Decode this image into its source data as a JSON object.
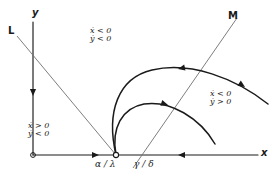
{
  "figure": {
    "type": "phase-plane-diagram",
    "background": "#ffffff",
    "ink": "#1a1a1a",
    "nullcline_color": "#6f6f6f",
    "width": 275,
    "height": 183
  },
  "axes": {
    "x_label": "x",
    "y_label": "y",
    "origin": {
      "x": 33,
      "y": 155
    },
    "x_axis": {
      "x1": 33,
      "y1": 155,
      "x2": 258,
      "y2": 155
    },
    "y_axis": {
      "x1": 33,
      "y1": 155,
      "x2": 33,
      "y2": 22
    }
  },
  "nullclines": [
    {
      "name": "L",
      "label": "L",
      "label_x": 8,
      "label_y": 26,
      "x1": 17,
      "y1": 36,
      "x2": 116,
      "y2": 155
    },
    {
      "name": "M",
      "label": "M",
      "label_x": 228,
      "label_y": 11,
      "x1": 237,
      "y1": 18,
      "x2": 133,
      "y2": 168
    }
  ],
  "tick_labels": [
    {
      "name": "alpha-over-lambda",
      "text": "α / λ",
      "x": 95,
      "y": 160
    },
    {
      "name": "gamma-over-delta",
      "text": "γ / δ",
      "x": 134,
      "y": 160
    }
  ],
  "equilibrium_point": {
    "x": 116,
    "y": 155,
    "r": 2.6,
    "filled": false
  },
  "regions": [
    {
      "name": "region-upper",
      "x_condition": "ẋ < 0",
      "y_condition": "ẏ < 0",
      "x": 90,
      "y": 27
    },
    {
      "name": "region-lower-left",
      "x_condition": "ẋ > 0",
      "y_condition": "ẏ < 0",
      "x": 28,
      "y": 122
    },
    {
      "name": "region-right",
      "x_condition": "ẋ < 0",
      "y_condition": "ẏ > 0",
      "x": 210,
      "y": 90
    }
  ],
  "trajectories": [
    {
      "name": "outer-trajectory",
      "path": "M 116 155 C 106 112, 118 78, 152 70 C 190 61, 235 78, 268 104",
      "arrows": [
        {
          "x": 178,
          "y": 69,
          "angle": 168
        },
        {
          "x": 245,
          "y": 87,
          "angle": 33
        }
      ]
    },
    {
      "name": "inner-trajectory",
      "path": "M 116 155 C 111 128, 122 108, 144 104 C 170 100, 200 118, 215 144",
      "arrows": [
        {
          "x": 168,
          "y": 105,
          "angle": 18
        }
      ]
    }
  ],
  "axis_arrows": [
    {
      "name": "y-axis-flow-arrow",
      "x": 33,
      "y": 96,
      "angle": 90
    },
    {
      "name": "x-axis-flow-left-arrow",
      "x": 99,
      "y": 155,
      "angle": 0
    },
    {
      "name": "x-axis-flow-right-arrow",
      "x": 178,
      "y": 155,
      "angle": 180
    }
  ]
}
